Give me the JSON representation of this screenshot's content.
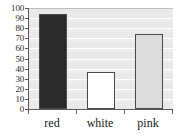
{
  "chart_data": {
    "type": "bar",
    "title": "",
    "subtitle": "",
    "xlabel": "",
    "ylabel": "",
    "categories": [
      "red",
      "white",
      "pink"
    ],
    "values": [
      94,
      37,
      74
    ],
    "series": [
      {
        "name": "",
        "values": [
          94,
          37,
          74
        ]
      }
    ],
    "ylim": [
      0,
      100
    ],
    "y_ticks": [
      0,
      10,
      20,
      30,
      40,
      50,
      60,
      70,
      80,
      90,
      100
    ],
    "y_tick_labels": [
      "0",
      "10",
      "20",
      "30",
      "40",
      "50",
      "60",
      "70",
      "80",
      "90",
      "100"
    ],
    "grid": true,
    "grid_axis": "y",
    "legend": false,
    "legend_position": "none",
    "bar_colors": [
      "#2b2b2b",
      "#ffffff",
      "#dcdcdc"
    ],
    "bar_edge_color": "#4a4a4a",
    "plot_background": "#e9e9e9",
    "gridline_color": "#ffffff",
    "axis_color": "#5a5a5a",
    "annotations": []
  }
}
